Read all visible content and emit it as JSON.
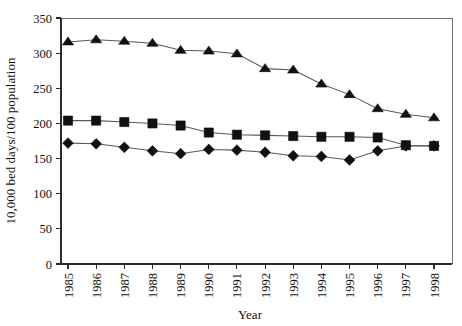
{
  "chart_data": {
    "type": "line",
    "title": "",
    "xlabel": "Year",
    "ylabel": "10,000 bed days/100 population",
    "categories": [
      "1985",
      "1986",
      "1987",
      "1988",
      "1989",
      "1990",
      "1991",
      "1992",
      "1993",
      "1994",
      "1995",
      "1996",
      "1997",
      "1998"
    ],
    "x": [
      1985,
      1986,
      1987,
      1988,
      1989,
      1990,
      1991,
      1992,
      1993,
      1994,
      1995,
      1996,
      1997,
      1998
    ],
    "ylim": [
      0,
      350
    ],
    "yticks": [
      0,
      50,
      100,
      150,
      200,
      250,
      300,
      350
    ],
    "ytick_labels": [
      "0",
      "50",
      "100",
      "150",
      "200",
      "250",
      "300",
      "350"
    ],
    "grid": false,
    "legend": "none",
    "xtick_rotation": 90,
    "series": [
      {
        "name": "triangle-series",
        "marker": "triangle",
        "color": "#111111",
        "values": [
          316,
          319,
          317,
          314,
          304,
          303,
          299,
          278,
          276,
          256,
          241,
          221,
          213,
          208
        ]
      },
      {
        "name": "square-series",
        "marker": "square",
        "color": "#111111",
        "values": [
          204,
          204,
          202,
          200,
          197,
          187,
          184,
          183,
          182,
          181,
          181,
          180,
          169,
          168
        ]
      },
      {
        "name": "diamond-series",
        "marker": "diamond",
        "color": "#111111",
        "values": [
          172,
          171,
          166,
          161,
          157,
          163,
          162,
          159,
          154,
          153,
          148,
          161,
          168,
          168
        ]
      }
    ]
  }
}
